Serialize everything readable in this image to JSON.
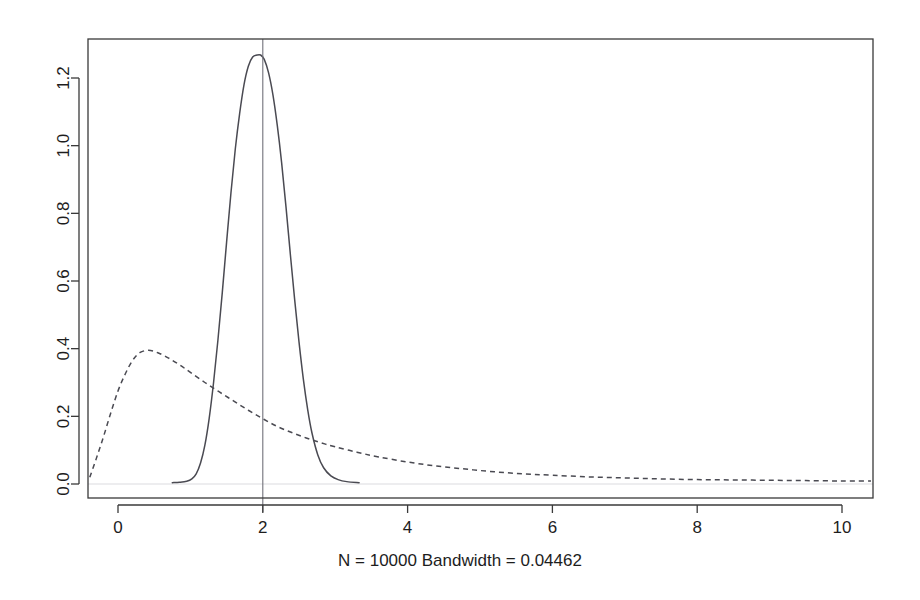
{
  "chart_data": {
    "type": "line",
    "title": "",
    "subtitle": "",
    "xlabel": "N = 10000   Bandwidth = 0.04462",
    "ylabel": "",
    "caption": "N = 10000   Bandwidth = 0.04462",
    "sample_size": 10000,
    "bandwidth": 0.04462,
    "grid": false,
    "legend_position": "none",
    "xlim": [
      -0.55,
      10.45
    ],
    "ylim": [
      -0.035,
      1.3
    ],
    "xticks": [
      0,
      2,
      4,
      6,
      8,
      10
    ],
    "xtick_labels": [
      "0",
      "2",
      "4",
      "6",
      "8",
      "10"
    ],
    "yticks": [
      0.0,
      0.2,
      0.4,
      0.6,
      0.8,
      1.0,
      1.2
    ],
    "ytick_labels": [
      "0.0",
      "0.2",
      "0.4",
      "0.6",
      "0.8",
      "1.0",
      "1.2"
    ],
    "annotations": [
      {
        "name": "reference-vline",
        "type": "vline",
        "x": 2,
        "style": "solid",
        "color": "#70707a"
      },
      {
        "name": "zero-baseline",
        "type": "hline",
        "y": 0,
        "style": "solid",
        "color": "#dcdce0"
      }
    ],
    "series": [
      {
        "name": "narrow-density",
        "style": "solid",
        "color": "#4a4a52",
        "peak_x": 1.97,
        "peak_y": 1.268,
        "x": [
          0.75,
          0.85,
          0.95,
          1.02,
          1.08,
          1.14,
          1.2,
          1.26,
          1.32,
          1.38,
          1.44,
          1.5,
          1.56,
          1.62,
          1.68,
          1.74,
          1.8,
          1.86,
          1.92,
          1.97,
          2.02,
          2.08,
          2.14,
          2.2,
          2.26,
          2.32,
          2.38,
          2.44,
          2.5,
          2.56,
          2.62,
          2.68,
          2.76,
          2.84,
          2.94,
          3.04,
          3.16,
          3.33
        ],
        "y": [
          0.004,
          0.005,
          0.008,
          0.015,
          0.03,
          0.062,
          0.115,
          0.195,
          0.3,
          0.425,
          0.565,
          0.715,
          0.86,
          0.99,
          1.095,
          1.18,
          1.235,
          1.262,
          1.268,
          1.268,
          1.255,
          1.215,
          1.15,
          1.06,
          0.95,
          0.82,
          0.68,
          0.545,
          0.42,
          0.31,
          0.22,
          0.15,
          0.086,
          0.048,
          0.024,
          0.013,
          0.007,
          0.004
        ]
      },
      {
        "name": "broad-density",
        "style": "dashed",
        "color": "#4a4a52",
        "peak_x": 0.42,
        "peak_y": 0.395,
        "x": [
          -0.39,
          -0.3,
          -0.2,
          -0.1,
          0.0,
          0.1,
          0.2,
          0.3,
          0.42,
          0.55,
          0.7,
          0.85,
          1.0,
          1.2,
          1.4,
          1.6,
          1.8,
          2.0,
          2.2,
          2.4,
          2.6,
          2.8,
          3.0,
          3.3,
          3.6,
          4.0,
          4.4,
          4.8,
          5.2,
          5.6,
          6.0,
          6.5,
          7.0,
          7.5,
          8.0,
          8.5,
          9.0,
          9.5,
          10.0,
          10.4
        ],
        "y": [
          0.02,
          0.075,
          0.14,
          0.21,
          0.275,
          0.325,
          0.365,
          0.388,
          0.395,
          0.388,
          0.372,
          0.352,
          0.33,
          0.3,
          0.272,
          0.245,
          0.218,
          0.193,
          0.17,
          0.152,
          0.136,
          0.122,
          0.11,
          0.094,
          0.08,
          0.065,
          0.053,
          0.044,
          0.036,
          0.03,
          0.026,
          0.021,
          0.018,
          0.015,
          0.013,
          0.012,
          0.011,
          0.01,
          0.009,
          0.009
        ]
      }
    ]
  }
}
